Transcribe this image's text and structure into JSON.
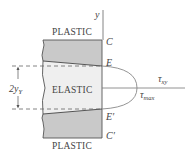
{
  "diagram": {
    "type": "stress-distribution",
    "regions": [
      {
        "name": "top-plastic",
        "label": "PLASTIC"
      },
      {
        "name": "elastic-core",
        "label": "ELASTIC"
      },
      {
        "name": "bottom-plastic",
        "label": "PLASTIC"
      }
    ],
    "labels": {
      "plastic_top": "PLASTIC",
      "elastic": "ELASTIC",
      "plastic_bottom": "PLASTIC",
      "axis_y": "y",
      "point_c": "C",
      "point_e": "E",
      "point_e_prime": "E′",
      "point_c_prime": "C′",
      "dimension_2yy_main": "2y",
      "dimension_2yy_sub": "Y",
      "tau_xy_main": "τ",
      "tau_xy_sub": "xy",
      "tau_max_main": "τ",
      "tau_max_sub": "max"
    },
    "colors": {
      "plastic_fill": "#c9c9c9",
      "elastic_fill": "#efefef",
      "outline": "#555555",
      "curve": "#888888",
      "text": "#444444"
    }
  }
}
